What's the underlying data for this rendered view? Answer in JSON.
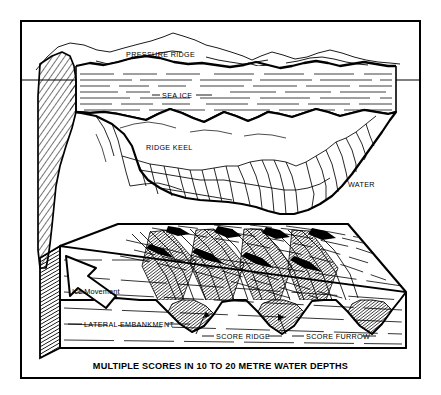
{
  "figure": {
    "title": "MULTIPLE SCORES IN 10 TO 20 METRE WATER DEPTHS",
    "kind": "technical-line-diagram",
    "colors": {
      "ink": "#000000",
      "paper": "#ffffff",
      "shading": "#1a1a1a"
    },
    "frame": {
      "border_color": "#000000",
      "border_width_px": 2
    }
  },
  "labels": {
    "pressure_ridge": "PRESSURE RIDGE",
    "sea_ice": "SEA ICE",
    "ridge_keel": "RIDGE KEEL",
    "water": "WATER",
    "ice_movement": "Ice Movement",
    "lateral_embankment": "LATERAL EMBANKMENT",
    "score_ridge": "SCORE RIDGE",
    "score_furrow": "SCORE FURROW"
  },
  "caption": "MULTIPLE SCORES IN 10 TO 20 METRE WATER DEPTHS",
  "annotations": {
    "arrow_direction": "up-left",
    "arrow_meaning": "direction of ice movement across the seabed"
  }
}
